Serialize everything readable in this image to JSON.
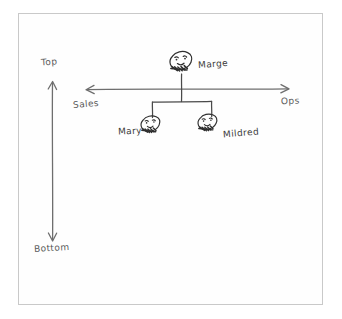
{
  "diagram": {
    "style": "hand-drawn sketch",
    "ink_color": "#3b3b3b",
    "pencil_color": "#5a5a5a",
    "frame_color": "#c9c9c9",
    "background_color": "#ffffff"
  },
  "axes": {
    "vertical": {
      "top_label": "Top",
      "bottom_label": "Bottom",
      "arrow": "double-headed"
    },
    "horizontal": {
      "left_label": "Sales",
      "right_label": "Ops",
      "arrow": "double-headed"
    }
  },
  "nodes": [
    {
      "id": "marge",
      "label": "Marge",
      "role": "root",
      "icon": "face-icon",
      "label_side": "right"
    },
    {
      "id": "mary",
      "label": "Mary",
      "role": "child",
      "icon": "face-icon",
      "label_side": "left"
    },
    {
      "id": "mildred",
      "label": "Mildred",
      "role": "child",
      "icon": "face-icon",
      "label_side": "right"
    }
  ],
  "edges": [
    {
      "from": "marge",
      "to": "mary"
    },
    {
      "from": "marge",
      "to": "mildred"
    }
  ]
}
